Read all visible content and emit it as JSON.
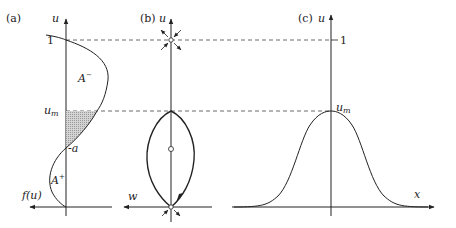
{
  "panels": {
    "a": {
      "label": "(a)",
      "y_axis": "u",
      "x_axis": "f(u)",
      "tick_1": "1",
      "tick_um": "u",
      "tick_um_sub": "m",
      "tick_a": "a",
      "region_minus": "A",
      "region_minus_sup": "−",
      "region_plus": "A",
      "region_plus_sup": "+"
    },
    "b": {
      "label": "(b)",
      "y_axis": "u",
      "x_axis": "w"
    },
    "c": {
      "label": "(c)",
      "y_axis": "u",
      "x_axis": "x",
      "tick_1": "1",
      "tick_um": "u",
      "tick_um_sub": "m"
    }
  },
  "colors": {
    "line": "#222222",
    "dash": "#444444",
    "shade": "#c8c8c8"
  }
}
